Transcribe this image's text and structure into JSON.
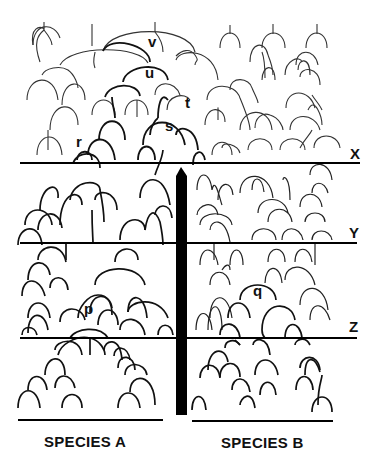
{
  "node_labels": {
    "v": "v",
    "u": "u",
    "t": "t",
    "s": "s",
    "r": "r",
    "p": "p",
    "q": "q"
  },
  "time_lines": [
    {
      "id": "X",
      "label": "X",
      "y": 163
    },
    {
      "id": "Y",
      "label": "Y",
      "y": 243
    },
    {
      "id": "Z",
      "label": "Z",
      "y": 338
    }
  ],
  "barrier": {
    "label": "barrier",
    "top": 168,
    "bottom": 415,
    "color": "#000000"
  },
  "species": [
    {
      "id": "A",
      "label": "SPECIES A"
    },
    {
      "id": "B",
      "label": "SPECIES B"
    }
  ],
  "colors": {
    "ink": "#111111",
    "light_ink": "#333333",
    "background": "#ffffff"
  }
}
